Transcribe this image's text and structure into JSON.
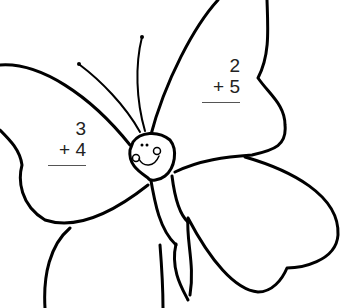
{
  "worksheet": {
    "subject": "butterfly addition coloring page",
    "problems": [
      {
        "top": "3",
        "operator": "+",
        "bottom": "4",
        "operator_line": "+ 4"
      },
      {
        "top": "2",
        "operator": "+",
        "bottom": "5",
        "operator_line": "+ 5"
      }
    ]
  },
  "colors": {
    "outline": "#000000",
    "text": "#222222",
    "background": "#ffffff"
  }
}
